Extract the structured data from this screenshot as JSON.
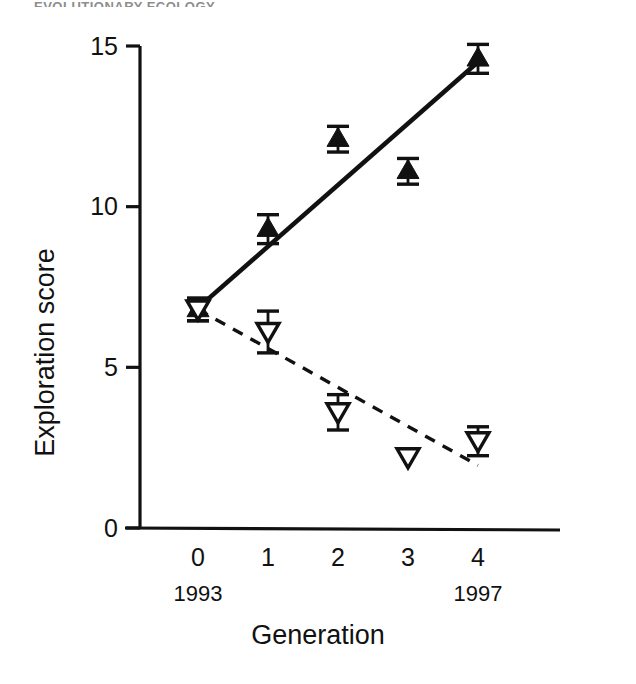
{
  "figure": {
    "top_cropped_text": "EVOLUTIONARY ECOLOGY",
    "background_color": "#ffffff",
    "ink_color": "#111111"
  },
  "chart_data": {
    "type": "scatter",
    "title": "",
    "xlabel": "Generation",
    "ylabel": "Exploration score",
    "x": [
      0,
      1,
      2,
      3,
      4
    ],
    "categories": [
      "0",
      "1",
      "2",
      "3",
      "4"
    ],
    "xtick_labels": [
      "0",
      "1",
      "2",
      "3",
      "4"
    ],
    "ytick_labels": [
      "0",
      "5",
      "10",
      "15"
    ],
    "yticks": [
      0,
      5,
      10,
      15
    ],
    "ylim": [
      0,
      15.6
    ],
    "xlim": [
      -0.55,
      4.55
    ],
    "grid": false,
    "legend_position": "none",
    "secondary_x_labels": [
      {
        "x": 0,
        "label": "1993"
      },
      {
        "x": 4,
        "label": "1997"
      }
    ],
    "series": [
      {
        "name": "High exploration line (filled up triangles)",
        "marker": "filled-triangle-up",
        "linestyle": "solid",
        "color": "#111111",
        "values": [
          6.8,
          9.3,
          12.1,
          11.1,
          14.6
        ],
        "err_low": [
          0.35,
          0.45,
          0.4,
          0.4,
          0.45
        ],
        "err_high": [
          0.35,
          0.45,
          0.4,
          0.4,
          0.45
        ],
        "trend_start": 6.85,
        "trend_end": 14.5
      },
      {
        "name": "Low exploration line (open down triangles)",
        "marker": "open-triangle-down",
        "linestyle": "dashed",
        "color": "#111111",
        "values": [
          6.8,
          6.1,
          3.6,
          2.2,
          2.7
        ],
        "err_low": [
          0.35,
          0.65,
          0.55,
          0.0,
          0.45
        ],
        "err_high": [
          0.35,
          0.65,
          0.55,
          0.0,
          0.45
        ],
        "trend_start": 6.8,
        "trend_end": 1.95
      }
    ]
  }
}
